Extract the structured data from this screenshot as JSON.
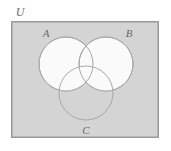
{
  "figure": {
    "kind": "venn-diagram",
    "set_count": 3,
    "page_background": "#ffffff"
  },
  "universe": {
    "label": "U",
    "label_position": "outside-top-left",
    "rect": {
      "x": 11,
      "y": 21,
      "width": 148,
      "height": 117
    },
    "fill": "#d4d4d4",
    "stroke": "#9a9a9a",
    "stroke_width": 1.5
  },
  "sets": [
    {
      "id": "A",
      "label": "A",
      "cx": 66,
      "cy": 64,
      "r": 27,
      "fill": "#fafafa",
      "stroke": "#a8a8a8",
      "label_x": 46,
      "label_y": 37
    },
    {
      "id": "B",
      "label": "B",
      "cx": 106,
      "cy": 64,
      "r": 27,
      "fill": "#fafafa",
      "stroke": "#a8a8a8",
      "label_x": 129,
      "label_y": 37
    },
    {
      "id": "C",
      "label": "C",
      "cx": 86,
      "cy": 93,
      "r": 27,
      "fill": "none",
      "stroke": "#a8a8a8",
      "label_x": 86,
      "label_y": 134
    }
  ],
  "shading": {
    "description": "Circles A and B are filled white; circle C is unfilled so the gray universe background shows through in the C-only region.",
    "shaded_regions": [
      "A",
      "B",
      "A-intersect-B",
      "A-intersect-C",
      "B-intersect-C",
      "A-intersect-B-intersect-C"
    ],
    "unshaded_regions": [
      "C-only",
      "universe-outside-all"
    ],
    "shaded_color": "#fafafa",
    "unshaded_color": "#d4d4d4"
  },
  "colors": {
    "background": "#ffffff",
    "universe_fill": "#d4d4d4",
    "universe_stroke": "#9a9a9a",
    "circle_fill": "#fafafa",
    "circle_stroke": "#a8a8a8",
    "label_text": "#6b6b6b"
  }
}
